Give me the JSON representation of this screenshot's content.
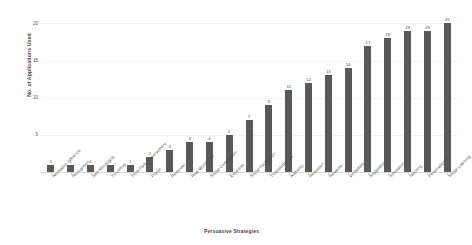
{
  "chart_data": {
    "type": "bar",
    "title": "",
    "xlabel": "Persuasive Strategies",
    "ylabel": "No. of Applications Used",
    "ylim": [
      0,
      21
    ],
    "yticks": [
      20,
      15,
      10,
      5
    ],
    "grid": true,
    "legend": null,
    "bar_color": "#595959",
    "categories": [
      "Normative Influence",
      "Recognition",
      "Self-Monitoring",
      "Tunneling",
      "Third Party Endorsement",
      "Praise",
      "Reminder",
      "Real World Feel",
      "Social Comparison",
      "Expertise",
      "Social Facilitation",
      "Trustworthiness",
      "Authority",
      "Reduction",
      "Rewards",
      "Verifiability",
      "Suggestion",
      "Simulation",
      "Tailoring",
      "Personalization",
      "Social Learning"
    ],
    "values": [
      1,
      1,
      1,
      1,
      1,
      2,
      3,
      4,
      4,
      5,
      7,
      9,
      11,
      12,
      13,
      14,
      17,
      18,
      19,
      19,
      20
    ],
    "value_labels": [
      "1",
      "1",
      "1",
      "1",
      "1",
      "2",
      "3",
      "4",
      "4",
      "5",
      "7",
      "9",
      "11",
      "12",
      "13",
      "14",
      "17",
      "18",
      "19",
      "19",
      "20"
    ]
  }
}
